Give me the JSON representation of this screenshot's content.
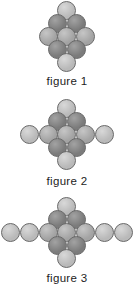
{
  "page": {
    "background": "#ffffff",
    "width": 134,
    "height": 290
  },
  "palette": {
    "dark": "#7b7b7b",
    "medium": "#a3a3a3",
    "light": "#b9b9b9",
    "outline": "#6b6b6b",
    "label_color": "#1d1d1d"
  },
  "figures": [
    {
      "id": "figure-1",
      "label": "figure 1",
      "dot_count": 9,
      "middle_row_count": 3,
      "label_top": 75,
      "field_top": 0,
      "field_height": 74,
      "dots": [
        {
          "name": "dot-top",
          "cx": 66,
          "cy": 10,
          "r": 9.5,
          "shade": "light"
        },
        {
          "name": "dot-upper-left",
          "cx": 57,
          "cy": 23,
          "r": 9.5,
          "shade": "dark"
        },
        {
          "name": "dot-upper-right",
          "cx": 76,
          "cy": 23,
          "r": 9.5,
          "shade": "dark"
        },
        {
          "name": "dot-mid-left",
          "cx": 48,
          "cy": 36,
          "r": 9.5,
          "shade": "medium"
        },
        {
          "name": "dot-mid-center",
          "cx": 66,
          "cy": 36,
          "r": 9.5,
          "shade": "medium"
        },
        {
          "name": "dot-mid-right",
          "cx": 85,
          "cy": 36,
          "r": 9.5,
          "shade": "medium"
        },
        {
          "name": "dot-lower-left",
          "cx": 57,
          "cy": 49,
          "r": 9.5,
          "shade": "dark"
        },
        {
          "name": "dot-lower-right",
          "cx": 76,
          "cy": 49,
          "r": 9.5,
          "shade": "dark"
        },
        {
          "name": "dot-bottom",
          "cx": 66,
          "cy": 62,
          "r": 9.5,
          "shade": "light"
        }
      ]
    },
    {
      "id": "figure-2",
      "label": "figure 2",
      "dot_count": 11,
      "middle_row_count": 5,
      "label_top": 175,
      "field_top": 98,
      "field_height": 74,
      "dots": [
        {
          "name": "dot-top",
          "cx": 66,
          "cy": 10,
          "r": 9.5,
          "shade": "light"
        },
        {
          "name": "dot-upper-left",
          "cx": 57,
          "cy": 23,
          "r": 9.5,
          "shade": "dark"
        },
        {
          "name": "dot-upper-right",
          "cx": 76,
          "cy": 23,
          "r": 9.5,
          "shade": "dark"
        },
        {
          "name": "dot-mid-far-left",
          "cx": 29,
          "cy": 36,
          "r": 9.5,
          "shade": "light"
        },
        {
          "name": "dot-mid-left",
          "cx": 48,
          "cy": 36,
          "r": 9.5,
          "shade": "medium"
        },
        {
          "name": "dot-mid-center",
          "cx": 66,
          "cy": 36,
          "r": 9.5,
          "shade": "medium"
        },
        {
          "name": "dot-mid-right",
          "cx": 85,
          "cy": 36,
          "r": 9.5,
          "shade": "medium"
        },
        {
          "name": "dot-mid-far-right",
          "cx": 104,
          "cy": 36,
          "r": 9.5,
          "shade": "light"
        },
        {
          "name": "dot-lower-left",
          "cx": 57,
          "cy": 49,
          "r": 9.5,
          "shade": "dark"
        },
        {
          "name": "dot-lower-right",
          "cx": 76,
          "cy": 49,
          "r": 9.5,
          "shade": "dark"
        },
        {
          "name": "dot-bottom",
          "cx": 66,
          "cy": 62,
          "r": 9.5,
          "shade": "light"
        }
      ]
    },
    {
      "id": "figure-3",
      "label": "figure 3",
      "dot_count": 13,
      "middle_row_count": 7,
      "label_top": 272,
      "field_top": 196,
      "field_height": 74,
      "dots": [
        {
          "name": "dot-top",
          "cx": 66,
          "cy": 10,
          "r": 9.5,
          "shade": "light"
        },
        {
          "name": "dot-upper-left",
          "cx": 57,
          "cy": 23,
          "r": 9.5,
          "shade": "dark"
        },
        {
          "name": "dot-upper-right",
          "cx": 76,
          "cy": 23,
          "r": 9.5,
          "shade": "dark"
        },
        {
          "name": "dot-mid-outer-left",
          "cx": 10,
          "cy": 36,
          "r": 9.5,
          "shade": "light"
        },
        {
          "name": "dot-mid-far-left",
          "cx": 29,
          "cy": 36,
          "r": 9.5,
          "shade": "light"
        },
        {
          "name": "dot-mid-left",
          "cx": 48,
          "cy": 36,
          "r": 9.5,
          "shade": "medium"
        },
        {
          "name": "dot-mid-center",
          "cx": 66,
          "cy": 36,
          "r": 9.5,
          "shade": "medium"
        },
        {
          "name": "dot-mid-right",
          "cx": 85,
          "cy": 36,
          "r": 9.5,
          "shade": "medium"
        },
        {
          "name": "dot-mid-far-right",
          "cx": 104,
          "cy": 36,
          "r": 9.5,
          "shade": "light"
        },
        {
          "name": "dot-mid-outer-right",
          "cx": 123,
          "cy": 36,
          "r": 9.5,
          "shade": "light"
        },
        {
          "name": "dot-lower-left",
          "cx": 57,
          "cy": 49,
          "r": 9.5,
          "shade": "dark"
        },
        {
          "name": "dot-lower-right",
          "cx": 76,
          "cy": 49,
          "r": 9.5,
          "shade": "dark"
        },
        {
          "name": "dot-bottom",
          "cx": 66,
          "cy": 62,
          "r": 9.5,
          "shade": "light"
        }
      ]
    }
  ]
}
